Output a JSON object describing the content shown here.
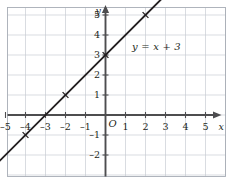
{
  "chart_data": {
    "type": "line",
    "title": "",
    "xlabel": "x",
    "ylabel": "y",
    "equation_label": "y = x + 3",
    "grid": true,
    "legend": "none",
    "xlim": [
      -5.9,
      6.05
    ],
    "ylim": [
      -3.4,
      5.9
    ],
    "x_ticks": [
      -5,
      -4,
      -3,
      -2,
      -1,
      1,
      2,
      3,
      4,
      5
    ],
    "y_ticks": [
      5,
      4,
      3,
      2,
      1,
      -1,
      -2
    ],
    "x_tick_labels": [
      "–5",
      "–4",
      "–3",
      "–2",
      "–1",
      "1",
      "2",
      "3",
      "4",
      "5"
    ],
    "y_tick_labels": [
      "5",
      "4",
      "3",
      "2",
      "1",
      "–1",
      "–2"
    ],
    "origin_label": "O",
    "series": [
      {
        "name": "y = x + 3",
        "slope": 1,
        "intercept": 3,
        "x": [
          -5.9,
          3.0
        ],
        "y": [
          -2.9,
          6.0
        ],
        "marker": "x",
        "points": [
          {
            "x": -4,
            "y": -1
          },
          {
            "x": -2,
            "y": 1
          },
          {
            "x": 0,
            "y": 3
          },
          {
            "x": 2,
            "y": 5
          }
        ]
      }
    ]
  },
  "style": {
    "line_color": "#231f20",
    "axis_color": "#4d4d4f",
    "grid_color": "#c8cdd4",
    "frame_color": "#a7adb5",
    "text_color": "#231f20",
    "background": "#ffffff"
  },
  "axes": {
    "x_axis_name": "x",
    "y_axis_name": "y"
  }
}
